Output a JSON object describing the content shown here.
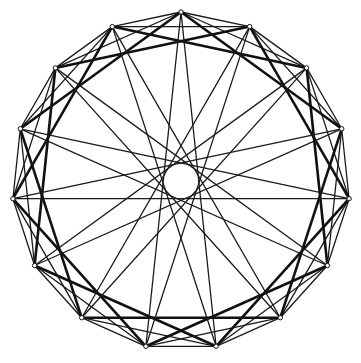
{
  "diagram": {
    "type": "circulant-graph",
    "vertex_count": 15,
    "center": [
      181,
      181
    ],
    "radius": 169,
    "start_angle_deg": -90,
    "edge_steps": [
      {
        "step": 1,
        "stroke_width": 1.3,
        "color": "#1a1a1a"
      },
      {
        "step": 2,
        "stroke_width": 1.3,
        "color": "#1a1a1a"
      },
      {
        "step": 3,
        "stroke_width": 2.6,
        "color": "#111111"
      },
      {
        "step": 7,
        "stroke_width": 1.3,
        "color": "#1a1a1a"
      }
    ],
    "vertex_marker": {
      "radius": 2.2,
      "fill": "#ffffff",
      "stroke": "#111111"
    },
    "background": "#ffffff"
  }
}
